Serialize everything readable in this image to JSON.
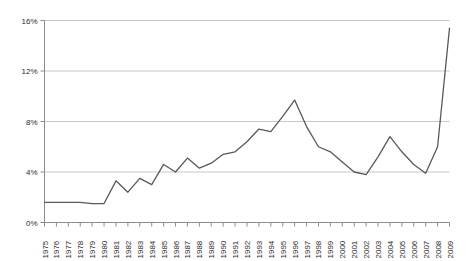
{
  "chart_data": {
    "type": "line",
    "title": "",
    "xlabel": "",
    "ylabel": "",
    "x": [
      1975,
      1976,
      1977,
      1978,
      1979,
      1980,
      1981,
      1982,
      1983,
      1984,
      1985,
      1986,
      1987,
      1988,
      1989,
      1990,
      1991,
      1992,
      1993,
      1994,
      1995,
      1996,
      1997,
      1998,
      1999,
      2000,
      2001,
      2002,
      2003,
      2004,
      2005,
      2006,
      2007,
      2008,
      2009
    ],
    "categories": [
      "1975",
      "1976",
      "1977",
      "1978",
      "1979",
      "1980",
      "1981",
      "1982",
      "1983",
      "1984",
      "1985",
      "1986",
      "1987",
      "1988",
      "1989",
      "1990",
      "1991",
      "1992",
      "1993",
      "1994",
      "1995",
      "1996",
      "1997",
      "1998",
      "1999",
      "2000",
      "2001",
      "2002",
      "2003",
      "2004",
      "2005",
      "2006",
      "2007",
      "2008",
      "2009"
    ],
    "values": [
      1.6,
      1.6,
      1.6,
      1.6,
      1.5,
      1.5,
      3.3,
      2.4,
      3.5,
      3.0,
      4.6,
      4.0,
      5.1,
      4.3,
      4.7,
      5.4,
      5.6,
      6.4,
      7.4,
      7.2,
      8.4,
      9.7,
      7.6,
      6.0,
      5.6,
      4.8,
      4.0,
      3.8,
      5.2,
      6.8,
      5.6,
      4.6,
      3.9,
      6.0,
      15.4
    ],
    "series": [
      {
        "name": "series-1",
        "values": [
          1.6,
          1.6,
          1.6,
          1.6,
          1.5,
          1.5,
          3.3,
          2.4,
          3.5,
          3.0,
          4.6,
          4.0,
          5.1,
          4.3,
          4.7,
          5.4,
          5.6,
          6.4,
          7.4,
          7.2,
          8.4,
          9.7,
          7.6,
          6.0,
          5.6,
          4.8,
          4.0,
          3.8,
          5.2,
          6.8,
          5.6,
          4.6,
          3.9,
          6.0,
          15.4
        ],
        "color": "#595959"
      }
    ],
    "ylim": [
      0,
      16
    ],
    "yticks": [
      0,
      4,
      8,
      12,
      16
    ],
    "ytick_labels": [
      "0%",
      "4%",
      "8%",
      "12%",
      "16%"
    ],
    "xtick_labels_rotated": true,
    "grid": true,
    "grid_axis": "y",
    "grid_color": "#c8c8c8",
    "legend": false,
    "legend_position": "none",
    "line_color": "#595959",
    "axis_color": "#8c8c8c",
    "background": "#ffffff",
    "markers": false
  }
}
